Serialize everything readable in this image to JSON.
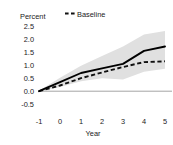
{
  "chart_data": {
    "type": "line",
    "title": "",
    "xlabel": "Year",
    "ylabel": "Percent",
    "xlim": [
      -1,
      5
    ],
    "ylim": [
      -0.5,
      2.5
    ],
    "grid": false,
    "legend_position": "top-center",
    "x": [
      -1,
      0,
      1,
      2,
      3,
      4,
      5
    ],
    "xticks": [
      "-1",
      "0",
      "1",
      "2",
      "3",
      "4",
      "5"
    ],
    "yticks": [
      "2.5",
      "2.0",
      "1.5",
      "1.0",
      "0.5",
      "0.0",
      "-0.5"
    ],
    "ytick_values": [
      2.5,
      2.0,
      1.5,
      1.0,
      0.5,
      0.0,
      -0.5
    ],
    "zero_line": 0.0,
    "series": [
      {
        "name": "Estimate",
        "style": "solid",
        "color": "#000000",
        "values": [
          0.0,
          0.35,
          0.7,
          0.88,
          1.05,
          1.55,
          1.72
        ]
      },
      {
        "name": "Baseline",
        "style": "dashed",
        "color": "#000000",
        "values": [
          0.0,
          0.22,
          0.5,
          0.72,
          0.93,
          1.12,
          1.15
        ]
      }
    ],
    "confidence_band": {
      "name": "confidence-interval",
      "color": "#e0e0e0",
      "upper": [
        0.02,
        0.52,
        0.98,
        1.35,
        1.72,
        2.18,
        2.32
      ],
      "lower": [
        -0.02,
        0.16,
        0.38,
        0.5,
        0.45,
        0.75,
        0.86
      ]
    }
  },
  "legend": {
    "entries": [
      {
        "label": "Baseline",
        "marker": "dashed-line-marker"
      }
    ]
  },
  "axes": {
    "y_axis_label": "Percent",
    "x_axis_label": "Year"
  }
}
